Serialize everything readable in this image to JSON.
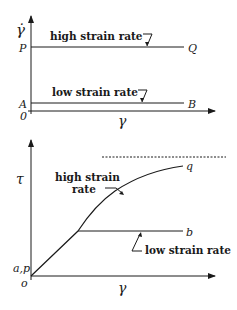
{
  "top_plot": {
    "y_axis_label": "γ̇",
    "x_axis_label": "γ",
    "origin_label": "0",
    "high_line": {
      "start_label": "P",
      "end_label": "Q",
      "annotation": "high strain rate"
    },
    "low_line": {
      "start_label": "A",
      "end_label": "B",
      "annotation": "low strain rate"
    }
  },
  "bottom_plot": {
    "y_axis_label": "τ",
    "x_axis_label": "γ",
    "origin_label": "o",
    "start_label": "a,p",
    "high_curve": {
      "end_label": "q",
      "annotation_line1": "high strain",
      "annotation_line2": "rate"
    },
    "low_line": {
      "end_label": "b",
      "annotation": "low strain rate"
    },
    "asymptote": "dashed"
  },
  "colors": {
    "ink": "#1a1a1a",
    "background": "#ffffff"
  }
}
